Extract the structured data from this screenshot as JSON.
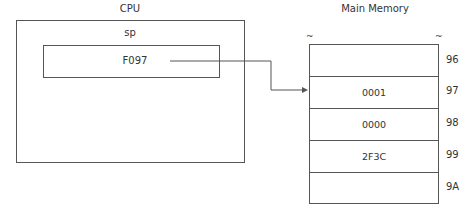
{
  "cpu": {
    "title": "CPU",
    "register_name": "sp",
    "register_value": "F097"
  },
  "memory": {
    "title": "Main Memory",
    "break_symbol": "~",
    "cells": [
      {
        "address": "96",
        "value": ""
      },
      {
        "address": "97",
        "value": "0001"
      },
      {
        "address": "98",
        "value": "0000"
      },
      {
        "address": "99",
        "value": "2F3C"
      },
      {
        "address": "9A",
        "value": ""
      }
    ]
  },
  "pointer": {
    "from": "sp",
    "to_address": "97"
  }
}
